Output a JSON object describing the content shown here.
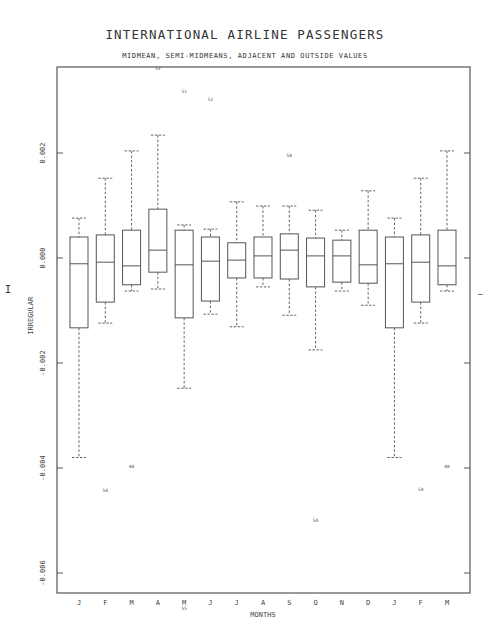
{
  "page": {
    "title": "INTERNATIONAL AIRLINE PASSENGERS",
    "subtitle": "MIDMEAN, SEMI-MIDMEANS, ADJACENT AND OUTSIDE VALUES",
    "left_mark": "I",
    "right_mark": "—"
  },
  "chart_data": {
    "type": "box",
    "title": "INTERNATIONAL AIRLINE PASSENGERS",
    "subtitle": "MIDMEAN, SEMI-MIDMEANS, ADJACENT AND OUTSIDE VALUES",
    "xlabel": "MONTHS",
    "ylabel": "IRREGULAR",
    "ylim": [
      -0.0065,
      0.0037
    ],
    "yticks": [
      0.002,
      0.0,
      -0.002,
      -0.004,
      -0.006
    ],
    "ytick_labels": [
      "0.002",
      "0.000",
      "-0.002",
      "-0.004",
      "-0.006"
    ],
    "grid": false,
    "categories": [
      "J",
      "F",
      "M",
      "A",
      "M",
      "J",
      "J",
      "A",
      "S",
      "O",
      "N",
      "D",
      "J",
      "F",
      "M"
    ],
    "boxes": [
      {
        "label": "J",
        "whisker_high": 0.00076,
        "upper": 0.0004,
        "center": -0.00011,
        "lower": -0.00133,
        "whisker_low": -0.0038
      },
      {
        "label": "F",
        "whisker_high": 0.00152,
        "upper": 0.00044,
        "center": -8e-05,
        "lower": -0.00084,
        "whisker_low": -0.00124
      },
      {
        "label": "M",
        "whisker_high": 0.00204,
        "upper": 0.00053,
        "center": -0.00015,
        "lower": -0.00051,
        "whisker_low": -0.00063
      },
      {
        "label": "A",
        "whisker_high": 0.00234,
        "upper": 0.00093,
        "center": 0.00015,
        "lower": -0.00027,
        "whisker_low": -0.00059
      },
      {
        "label": "M",
        "whisker_high": 0.00063,
        "upper": 0.00053,
        "center": -0.00013,
        "lower": -0.00114,
        "whisker_low": -0.00248
      },
      {
        "label": "J",
        "whisker_high": 0.00055,
        "upper": 0.0004,
        "center": -6e-05,
        "lower": -0.00082,
        "whisker_low": -0.00107
      },
      {
        "label": "J",
        "whisker_high": 0.00107,
        "upper": 0.00029,
        "center": -4e-05,
        "lower": -0.00038,
        "whisker_low": -0.00131
      },
      {
        "label": "A",
        "whisker_high": 0.00099,
        "upper": 0.0004,
        "center": 4e-05,
        "lower": -0.00038,
        "whisker_low": -0.00055
      },
      {
        "label": "S",
        "whisker_high": 0.00099,
        "upper": 0.00046,
        "center": 0.00015,
        "lower": -0.0004,
        "whisker_low": -0.00109
      },
      {
        "label": "O",
        "whisker_high": 0.00091,
        "upper": 0.00038,
        "center": 4e-05,
        "lower": -0.00055,
        "whisker_low": -0.00175
      },
      {
        "label": "N",
        "whisker_high": 0.00053,
        "upper": 0.00034,
        "center": 4e-05,
        "lower": -0.00046,
        "whisker_low": -0.00063
      },
      {
        "label": "D",
        "whisker_high": 0.00128,
        "upper": 0.00053,
        "center": -0.00013,
        "lower": -0.00048,
        "whisker_low": -0.0009
      },
      {
        "label": "J",
        "whisker_high": 0.00076,
        "upper": 0.0004,
        "center": -0.00011,
        "lower": -0.00133,
        "whisker_low": -0.0038
      },
      {
        "label": "F",
        "whisker_high": 0.00152,
        "upper": 0.00044,
        "center": -8e-05,
        "lower": -0.00084,
        "whisker_low": -0.00124
      },
      {
        "label": "M",
        "whisker_high": 0.00204,
        "upper": 0.00053,
        "center": -0.00015,
        "lower": -0.00051,
        "whisker_low": -0.00063
      }
    ],
    "outside_values": [
      {
        "index": 3,
        "value": 0.00358,
        "label": "53"
      },
      {
        "index": 4,
        "value": 0.00314,
        "label": "51"
      },
      {
        "index": 5,
        "value": 0.00299,
        "label": "52"
      },
      {
        "index": 8,
        "value": 0.00192,
        "label": "58"
      },
      {
        "index": 2,
        "value": -0.004,
        "label": "48"
      },
      {
        "index": 1,
        "value": -0.00446,
        "label": "54"
      },
      {
        "index": 9,
        "value": -0.00503,
        "label": "50"
      },
      {
        "index": 4,
        "value": -0.0067,
        "label": "55"
      },
      {
        "index": 13,
        "value": -0.00444,
        "label": "54"
      },
      {
        "index": 14,
        "value": -0.004,
        "label": "48"
      }
    ]
  }
}
